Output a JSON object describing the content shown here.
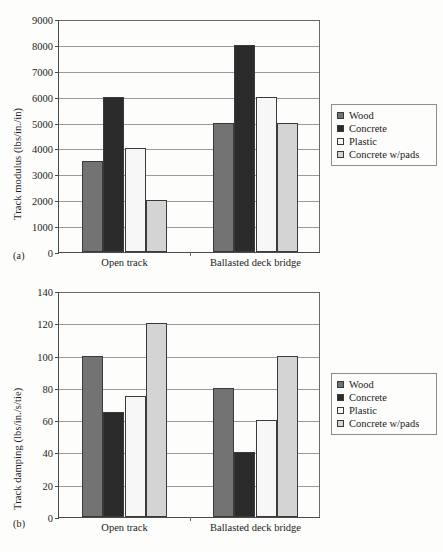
{
  "figure": {
    "panel_a_label": "(a)",
    "panel_b_label": "(b)"
  },
  "legend": {
    "items": [
      {
        "label": "Wood",
        "color": "#737373"
      },
      {
        "label": "Concrete",
        "color": "#2b2b2b"
      },
      {
        "label": "Plastic",
        "color": "#f7f7f7"
      },
      {
        "label": "Concrete w/pads",
        "color": "#d4d4d4"
      }
    ]
  },
  "chart_data": [
    {
      "type": "bar",
      "panel": "(a)",
      "title": "",
      "xlabel": "",
      "ylabel": "Track modulus (lbs/in./in)",
      "categories": [
        "Open track",
        "Ballasted deck bridge"
      ],
      "series": [
        {
          "name": "Wood",
          "color": "#737373",
          "values": [
            3500,
            5000
          ]
        },
        {
          "name": "Concrete",
          "color": "#2b2b2b",
          "values": [
            6000,
            8000
          ]
        },
        {
          "name": "Plastic",
          "color": "#f7f7f7",
          "values": [
            4000,
            6000
          ]
        },
        {
          "name": "Concrete w/pads",
          "color": "#d4d4d4",
          "values": [
            2000,
            5000
          ]
        }
      ],
      "ylim": [
        0,
        9000
      ],
      "ytick_step": 1000,
      "yticks": [
        0,
        1000,
        2000,
        3000,
        4000,
        5000,
        6000,
        7000,
        8000,
        9000
      ],
      "ytick_labels": [
        "0",
        "1000",
        "2000",
        "3000",
        "4000",
        "5000",
        "6000",
        "7000",
        "8000",
        "9000"
      ],
      "grid": true,
      "legend_position": "right"
    },
    {
      "type": "bar",
      "panel": "(b)",
      "title": "",
      "xlabel": "",
      "ylabel": "Track damping (lbs/in./s/tie)",
      "categories": [
        "Open track",
        "Ballasted deck bridge"
      ],
      "series": [
        {
          "name": "Wood",
          "color": "#737373",
          "values": [
            100,
            80
          ]
        },
        {
          "name": "Concrete",
          "color": "#2b2b2b",
          "values": [
            65,
            40
          ]
        },
        {
          "name": "Plastic",
          "color": "#f7f7f7",
          "values": [
            75,
            60
          ]
        },
        {
          "name": "Concrete w/pads",
          "color": "#d4d4d4",
          "values": [
            120,
            100
          ]
        }
      ],
      "ylim": [
        0,
        140
      ],
      "ytick_step": 20,
      "yticks": [
        0,
        20,
        40,
        60,
        80,
        100,
        120,
        140
      ],
      "ytick_labels": [
        "0",
        "20",
        "40",
        "60",
        "80",
        "100",
        "120",
        "140"
      ],
      "grid": true,
      "legend_position": "right"
    }
  ]
}
